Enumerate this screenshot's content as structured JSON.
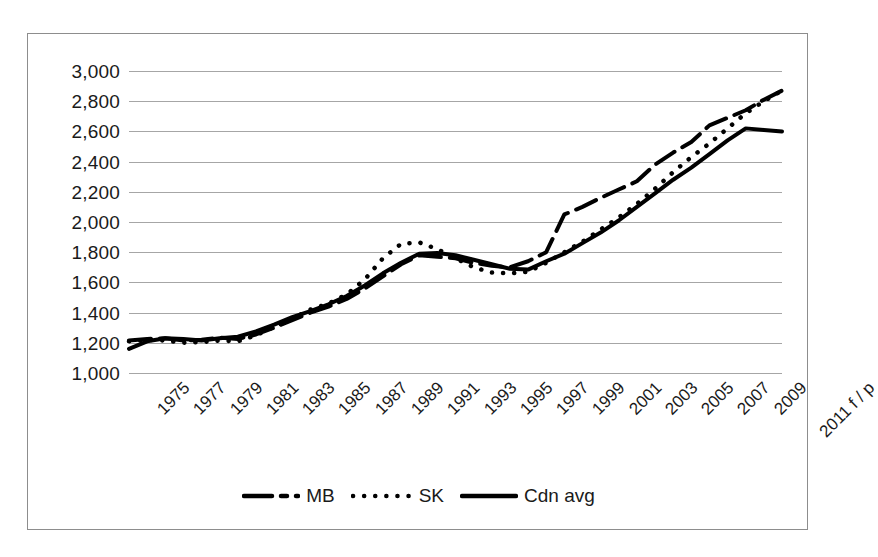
{
  "chart_data": {
    "type": "line",
    "title": "",
    "subtitle": "",
    "xlabel": "",
    "ylabel": "",
    "grid": true,
    "legend_position": "bottom",
    "ylim": [
      1000,
      3000
    ],
    "ytick_step": 200,
    "ytick_labels": [
      "3,000",
      "2,800",
      "2,600",
      "2,400",
      "2,200",
      "2,000",
      "1,800",
      "1,600",
      "1,400",
      "1,200",
      "1,000"
    ],
    "ytick_values": [
      3000,
      2800,
      2600,
      2400,
      2200,
      2000,
      1800,
      1600,
      1400,
      1200,
      1000
    ],
    "categories": [
      "1975",
      "1976",
      "1977",
      "1978",
      "1979",
      "1980",
      "1981",
      "1982",
      "1983",
      "1984",
      "1985",
      "1986",
      "1987",
      "1988",
      "1989",
      "1990",
      "1991",
      "1992",
      "1993",
      "1994",
      "1995",
      "1996",
      "1997",
      "1998",
      "1999",
      "2000",
      "2001",
      "2002",
      "2003",
      "2004",
      "2005",
      "2006",
      "2007",
      "2008",
      "2009",
      "2010",
      "2011 f / p"
    ],
    "xtick_labels": [
      "1975",
      "1977",
      "1979",
      "1981",
      "1983",
      "1985",
      "1987",
      "1989",
      "1991",
      "1993",
      "1995",
      "1997",
      "1999",
      "2001",
      "2003",
      "2005",
      "2007",
      "2009",
      "2011 f / p"
    ],
    "series": [
      {
        "name": "MB",
        "style": "dashed",
        "color": "#000000",
        "values": [
          1215,
          1225,
          1230,
          1215,
          1220,
          1235,
          1225,
          1255,
          1300,
          1350,
          1400,
          1440,
          1490,
          1560,
          1640,
          1720,
          1780,
          1770,
          1760,
          1730,
          1710,
          1700,
          1740,
          1800,
          2050,
          2100,
          2160,
          2215,
          2270,
          2380,
          2460,
          2530,
          2640,
          2690,
          2740,
          2810,
          2870
        ]
      },
      {
        "name": "SK",
        "style": "dotted",
        "color": "#000000",
        "values": [
          1210,
          1220,
          1215,
          1200,
          1205,
          1215,
          1210,
          1250,
          1305,
          1360,
          1420,
          1460,
          1520,
          1620,
          1760,
          1855,
          1865,
          1820,
          1760,
          1700,
          1665,
          1660,
          1670,
          1730,
          1800,
          1870,
          1950,
          2030,
          2120,
          2220,
          2330,
          2430,
          2520,
          2620,
          2720,
          2800,
          2870
        ]
      },
      {
        "name": "Cdn avg",
        "style": "solid",
        "color": "#000000",
        "values": [
          1160,
          1210,
          1230,
          1225,
          1215,
          1230,
          1240,
          1275,
          1320,
          1370,
          1410,
          1455,
          1510,
          1580,
          1660,
          1730,
          1790,
          1795,
          1780,
          1750,
          1720,
          1690,
          1685,
          1740,
          1790,
          1860,
          1930,
          2010,
          2100,
          2190,
          2280,
          2360,
          2450,
          2540,
          2620,
          2610,
          2600
        ]
      }
    ]
  },
  "legend": {
    "items": [
      {
        "label": "MB",
        "style": "dashed"
      },
      {
        "label": "SK",
        "style": "dotted"
      },
      {
        "label": "Cdn avg",
        "style": "solid"
      }
    ]
  }
}
